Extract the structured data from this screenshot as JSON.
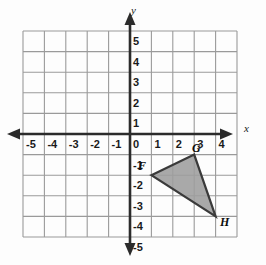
{
  "figure": {
    "kind": "coordinate-plane-triangle",
    "background_color": "#fdfdfd",
    "grid_color": "#9a9a9a",
    "axis_color": "#2b2b2b",
    "shape_fill_color": "#9d9d9d",
    "shape_stroke_color": "#3a3a3a"
  },
  "axes": {
    "x_label": "x",
    "y_label": "y",
    "x_min": -5,
    "x_max": 5,
    "y_min": -5,
    "y_max": 5,
    "x_tick_labels": [
      "-5",
      "-4",
      "-3",
      "-2",
      "-1",
      "0",
      "1",
      "2",
      "3",
      "4"
    ],
    "y_tick_labels": [
      "5",
      "4",
      "3",
      "2",
      "1",
      "0",
      "-1",
      "-2",
      "-3",
      "-4",
      "-5"
    ],
    "x_tick_values": [
      -5,
      -4,
      -3,
      -2,
      -1,
      0,
      1,
      2,
      3,
      4
    ],
    "y_tick_values": [
      5,
      4,
      3,
      2,
      1,
      0,
      -1,
      -2,
      -3,
      -4,
      -5
    ]
  },
  "shape": {
    "name": "triangle-fgh",
    "vertices": [
      {
        "label": "F",
        "x": 1,
        "y": -2
      },
      {
        "label": "G",
        "x": 3,
        "y": -1
      },
      {
        "label": "H",
        "x": 4,
        "y": -4
      }
    ]
  }
}
